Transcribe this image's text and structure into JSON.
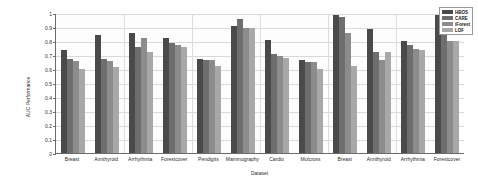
{
  "chart_data": {
    "type": "bar",
    "title": "",
    "xlabel": "Dataset",
    "ylabel": "AUC Performance",
    "ylim": [
      0,
      1
    ],
    "yticks": [
      "0",
      "0.1",
      "0.2",
      "0.3",
      "0.4",
      "0.5",
      "0.6",
      "0.7",
      "0.8",
      "0.9",
      "1"
    ],
    "grid": true,
    "legend_position": "top-right",
    "categories": [
      "Breast",
      "Annthyroid",
      "Arrhythmia",
      "Forestcover",
      "Pendigits",
      "Mammography",
      "Cardio",
      "Mulcross",
      "Breast",
      "Annthyroid",
      "Arrhythmia",
      "Forestcover"
    ],
    "series": [
      {
        "name": "HBOS",
        "color": "#4a4a4a",
        "values": [
          0.735,
          0.845,
          0.855,
          0.82,
          0.672,
          0.905,
          0.805,
          0.665,
          0.985,
          0.885,
          0.8,
          0.985
        ]
      },
      {
        "name": "CARE",
        "color": "#6e6e6e",
        "values": [
          0.67,
          0.672,
          0.755,
          0.785,
          0.665,
          0.96,
          0.705,
          0.65,
          0.975,
          0.72,
          0.775,
          0.95
        ]
      },
      {
        "name": "iForest",
        "color": "#8c8c8c",
        "values": [
          0.655,
          0.66,
          0.822,
          0.772,
          0.665,
          0.895,
          0.69,
          0.65,
          0.855,
          0.665,
          0.745,
          0.8
        ]
      },
      {
        "name": "LOF",
        "color": "#a8a8a8",
        "values": [
          0.6,
          0.612,
          0.72,
          0.755,
          0.62,
          0.895,
          0.68,
          0.6,
          0.625,
          0.72,
          0.735,
          0.8
        ]
      }
    ]
  },
  "legend": {
    "entries": [
      {
        "label": "HBOS"
      },
      {
        "label": "CARE"
      },
      {
        "label": "iForest"
      },
      {
        "label": "LOF"
      }
    ]
  }
}
